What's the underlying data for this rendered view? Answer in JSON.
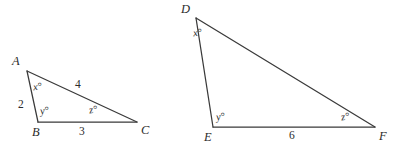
{
  "figure": {
    "stroke_color": "#3a3a3a",
    "text_color": "#2b2b2b",
    "background_color": "#ffffff"
  },
  "triangle_left": {
    "name": "triangle-abc",
    "vertices": {
      "A": {
        "label": "A",
        "x": 27,
        "y": 71
      },
      "B": {
        "label": "B",
        "x": 38,
        "y": 122
      },
      "C": {
        "label": "C",
        "x": 137,
        "y": 122
      }
    },
    "angles": {
      "at_A": "x°",
      "at_B": "y°",
      "at_C": "z°"
    },
    "sides": {
      "AB": "2",
      "AC": "4",
      "BC": "3"
    }
  },
  "triangle_right": {
    "name": "triangle-def",
    "vertices": {
      "D": {
        "label": "D",
        "x": 196,
        "y": 18
      },
      "E": {
        "label": "E",
        "x": 213,
        "y": 127
      },
      "F": {
        "label": "F",
        "x": 375,
        "y": 127
      }
    },
    "angles": {
      "at_D": "x°",
      "at_E": "y°",
      "at_F": "z°"
    },
    "sides": {
      "DE": "",
      "DF": "",
      "EF": "6"
    }
  }
}
